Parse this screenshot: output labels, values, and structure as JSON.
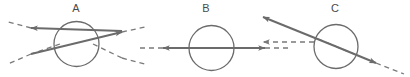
{
  "figure": {
    "width": 410,
    "height": 77,
    "background": "#ffffff",
    "stroke_color": "#6b6b6b",
    "dash_color": "#7a7a7a",
    "label_color": "#4a4a4a",
    "stroke_width": 2,
    "dash_width": 1.3,
    "dash_pattern": "5,4"
  },
  "panels": [
    {
      "id": "A",
      "label": "A",
      "label_x": 76,
      "label_y": 9,
      "circle": {
        "cx": 76.5,
        "cy": 44,
        "r": 22.5
      },
      "rays": [
        {
          "name": "incoming-ray-from-lower-left",
          "type": "solid-arrow",
          "x1": 122,
          "y1": 31,
          "x2": 31,
          "y2": 28,
          "arrow_at": "end",
          "note": "solid ray travelling up-left through sphere, arrowhead at left"
        },
        {
          "name": "incoming-ray-from-lower-right",
          "type": "solid-arrow",
          "x1": 31,
          "y1": 54,
          "x2": 122,
          "y2": 32,
          "arrow_at": "end",
          "note": "solid ray travelling up-right through sphere, arrowhead at right"
        }
      ],
      "dashes": [
        {
          "name": "dash-upper-left-extension",
          "x1": 31,
          "y1": 28,
          "x2": 8,
          "y2": 22
        },
        {
          "name": "dash-upper-right-extension",
          "x1": 122,
          "y1": 32,
          "x2": 145,
          "y2": 27
        },
        {
          "name": "dash-lower-left-extension",
          "x1": 31,
          "y1": 54,
          "x2": 8,
          "y2": 64
        },
        {
          "name": "dash-lower-right-extension",
          "x1": 122,
          "y1": 58,
          "x2": 145,
          "y2": 64
        },
        {
          "name": "dash-chord-lower-left",
          "x1": 60,
          "y1": 44,
          "x2": 31,
          "y2": 54
        },
        {
          "name": "dash-chord-lower-right",
          "x1": 93,
          "y1": 44,
          "x2": 122,
          "y2": 58
        }
      ]
    },
    {
      "id": "B",
      "label": "B",
      "label_x": 206,
      "label_y": 9,
      "circle": {
        "cx": 211.5,
        "cy": 48,
        "r": 22.5
      },
      "rays": [
        {
          "name": "left-going-ray",
          "type": "solid-arrow",
          "x1": 211,
          "y1": 48,
          "x2": 163,
          "y2": 48,
          "arrow_at": "end",
          "note": "solid ray travelling left, arrowhead left of sphere"
        },
        {
          "name": "right-going-ray",
          "type": "solid-arrow",
          "x1": 211,
          "y1": 48,
          "x2": 265,
          "y2": 48,
          "arrow_at": "end",
          "note": "solid ray travelling right, arrowhead right of sphere"
        }
      ],
      "dashes": [
        {
          "name": "dash-left-extension",
          "x1": 163,
          "y1": 48,
          "x2": 139,
          "y2": 48
        },
        {
          "name": "dash-right-extension",
          "x1": 265,
          "y1": 48,
          "x2": 289,
          "y2": 48
        },
        {
          "name": "dash-axis-inside-sphere",
          "x1": 190,
          "y1": 48,
          "x2": 234,
          "y2": 48
        }
      ]
    },
    {
      "id": "C",
      "label": "C",
      "label_x": 335,
      "label_y": 9,
      "circle": {
        "cx": 336,
        "cy": 46.5,
        "r": 22
      },
      "rays": [
        {
          "name": "diagonal-ray-up-left",
          "type": "solid-arrow",
          "x1": 336,
          "y1": 46.5,
          "x2": 263,
          "y2": 17,
          "arrow_at": "end",
          "note": "solid diagonal ray travelling up-left, arrowhead upper left"
        },
        {
          "name": "diagonal-ray-down-right",
          "type": "solid-arrow",
          "x1": 336,
          "y1": 46.5,
          "x2": 376,
          "y2": 63,
          "arrow_at": "end",
          "note": "solid diagonal ray travelling down-right, arrowhead lower right"
        },
        {
          "name": "horizontal-dashed-ray-left",
          "type": "dashed-arrow",
          "x1": 314,
          "y1": 42,
          "x2": 263,
          "y2": 42,
          "arrow_at": "end",
          "note": "dashed horizontal reference ray pointing left"
        }
      ],
      "dashes": [
        {
          "name": "dash-chord-inside-sphere",
          "x1": 318,
          "y1": 39,
          "x2": 354,
          "y2": 54
        },
        {
          "name": "dash-lower-right-extension",
          "x1": 376,
          "y1": 63,
          "x2": 404,
          "y2": 74
        }
      ]
    }
  ]
}
